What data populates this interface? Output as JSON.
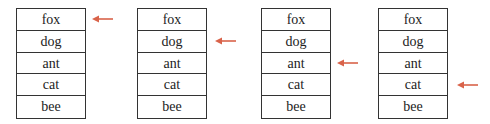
{
  "colors": {
    "arrow": "#d9634a",
    "border": "#333333",
    "text": "#222222"
  },
  "stacks": [
    {
      "items": [
        "fox",
        "dog",
        "ant",
        "cat",
        "bee"
      ],
      "pointer_index": 0
    },
    {
      "items": [
        "fox",
        "dog",
        "ant",
        "cat",
        "bee"
      ],
      "pointer_index": 1
    },
    {
      "items": [
        "fox",
        "dog",
        "ant",
        "cat",
        "bee"
      ],
      "pointer_index": 2
    },
    {
      "items": [
        "fox",
        "dog",
        "ant",
        "cat",
        "bee"
      ],
      "pointer_index": 3
    }
  ]
}
